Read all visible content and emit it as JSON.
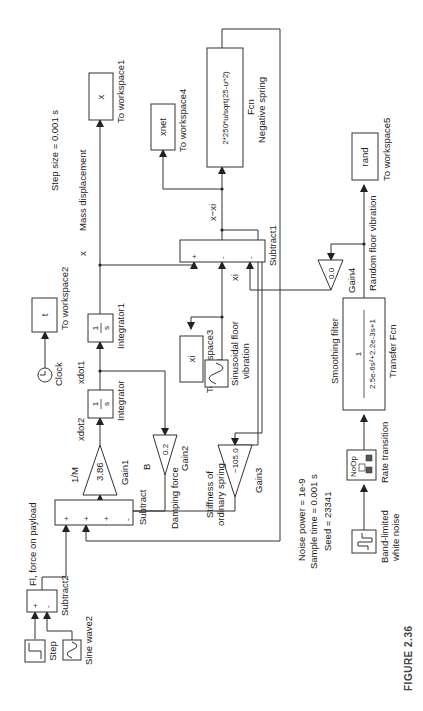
{
  "figure": {
    "caption": "FIGURE 2.36"
  },
  "annotations": {
    "step_size": "Step size = 0.001 s",
    "noise_power": "Noise power = 1e-9",
    "sample_time": "Sample time = 0.001 s",
    "seed": "Seed = 23341"
  },
  "blocks": {
    "step": {
      "name": "Step"
    },
    "sine_wave2": {
      "name": "Sine wave2"
    },
    "subtract2": {
      "name": "Subtract2",
      "signs": [
        "+",
        "-"
      ],
      "output_label": "Fl, force on payload"
    },
    "subtract": {
      "name": "Subtract",
      "signs": [
        "+",
        "+",
        "+",
        "-"
      ]
    },
    "gain1": {
      "name": "Gain1",
      "value": "3.86",
      "label": "1/M"
    },
    "integrator": {
      "name": "Integrator",
      "glyph_num": "1",
      "glyph_den": "s",
      "input_label": "xdot2"
    },
    "integrator1": {
      "name": "Integrator1",
      "glyph_num": "1",
      "glyph_den": "s",
      "input_label": "xdot1"
    },
    "clock": {
      "name": "Clock"
    },
    "to_workspace2": {
      "name": "To workspace2",
      "var": "t"
    },
    "to_workspace1": {
      "name": "To workspace1",
      "var": "x"
    },
    "mass_displacement": {
      "symbol": "x",
      "label": "Mass displacement"
    },
    "gain2": {
      "name": "Gain2",
      "value": "0.2",
      "label": "B",
      "desc": "Damping force"
    },
    "gain3": {
      "name": "Gain3",
      "value": "−105.0",
      "desc_line1": "Stiffness of",
      "desc_line2": "ordinary spring"
    },
    "subtract1": {
      "name": "Subtract1",
      "signs": [
        "+",
        "-",
        "-"
      ],
      "output_label": "x−xi",
      "input_label": "xi"
    },
    "to_workspace3": {
      "name": "To workspace3",
      "var": "xi"
    },
    "sine_floor": {
      "name_line1": "Sinusoidal floor",
      "name_line2": "vibration"
    },
    "fcn": {
      "name": "Fcn",
      "expr": "2*250*u/sqrt(25-u^2)",
      "desc": "Negative spring"
    },
    "to_workspace4": {
      "name": "To workspace4",
      "var": "xnet"
    },
    "gain4": {
      "name": "Gain4",
      "value": "0.0"
    },
    "transfer_fcn": {
      "name": "Transfer Fcn",
      "title": "Smoothing filter",
      "num": "1",
      "den": "2.5e-6s²+2.2e-3s+1"
    },
    "random_vib": {
      "label": "Random floor vibration"
    },
    "to_workspace5": {
      "name": "To workspace5",
      "var": "rand"
    },
    "rate_transition": {
      "name": "Rate transition",
      "glyph": "NoOp"
    },
    "noise": {
      "name_line1": "Band-limited",
      "name_line2": "white noise"
    }
  }
}
